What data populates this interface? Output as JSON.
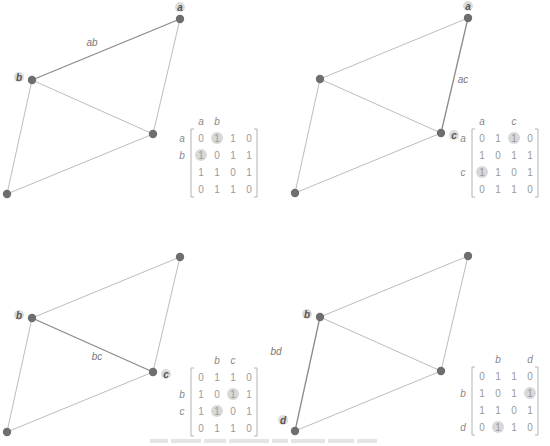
{
  "figure": {
    "panels": [
      {
        "id": "ab",
        "edge_label": "ab",
        "highlight_edge": [
          "a",
          "b"
        ],
        "node_labels": {
          "a": "a",
          "b": "b"
        },
        "col_headers": [
          "a",
          "b",
          "",
          ""
        ],
        "row_headers": [
          "a",
          "b",
          "",
          ""
        ],
        "highlight_cells": [
          [
            0,
            1
          ],
          [
            1,
            0
          ]
        ]
      },
      {
        "id": "ac",
        "edge_label": "ac",
        "highlight_edge": [
          "a",
          "c"
        ],
        "node_labels": {
          "a": "a",
          "c": "c"
        },
        "col_headers": [
          "a",
          "",
          "c",
          ""
        ],
        "row_headers": [
          "a",
          "",
          "c",
          ""
        ],
        "highlight_cells": [
          [
            0,
            2
          ],
          [
            2,
            0
          ]
        ]
      },
      {
        "id": "bc",
        "edge_label": "bc",
        "highlight_edge": [
          "b",
          "c"
        ],
        "node_labels": {
          "b": "b",
          "c": "c"
        },
        "col_headers": [
          "",
          "b",
          "c",
          ""
        ],
        "row_headers": [
          "",
          "b",
          "c",
          ""
        ],
        "highlight_cells": [
          [
            1,
            2
          ],
          [
            2,
            1
          ]
        ]
      },
      {
        "id": "bd",
        "edge_label": "bd",
        "highlight_edge": [
          "b",
          "d"
        ],
        "node_labels": {
          "b": "b",
          "d": "d"
        },
        "col_headers": [
          "",
          "b",
          "",
          "d"
        ],
        "row_headers": [
          "",
          "b",
          "",
          "d"
        ],
        "highlight_cells": [
          [
            1,
            3
          ],
          [
            3,
            1
          ]
        ]
      }
    ],
    "adjacency_matrix": [
      [
        0,
        1,
        1,
        0
      ],
      [
        1,
        0,
        1,
        1
      ],
      [
        1,
        1,
        0,
        1
      ],
      [
        0,
        1,
        1,
        0
      ]
    ],
    "graph_edges": [
      [
        "a",
        "b"
      ],
      [
        "a",
        "c"
      ],
      [
        "b",
        "c"
      ],
      [
        "b",
        "d"
      ],
      [
        "c",
        "d"
      ]
    ],
    "caption": ""
  }
}
